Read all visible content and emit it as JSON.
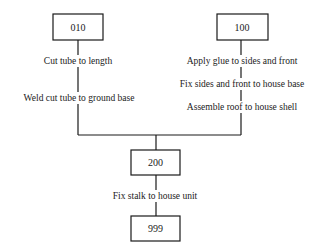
{
  "diagram": {
    "type": "assembly-process-chart",
    "nodes": {
      "n010": "010",
      "n100": "100",
      "n200": "200",
      "n999": "999"
    },
    "left_branch": {
      "steps": [
        "Cut tube to length",
        "Weld cut tube to ground base"
      ]
    },
    "right_branch": {
      "steps": [
        "Apply glue to sides and front",
        "Fix sides and front to house base",
        "Assemble roof to house shell"
      ]
    },
    "final_branch": {
      "steps": [
        "Fix stalk to house unit"
      ]
    },
    "edges": [
      {
        "from": "010",
        "to": "200"
      },
      {
        "from": "100",
        "to": "200"
      },
      {
        "from": "200",
        "to": "999"
      }
    ]
  }
}
